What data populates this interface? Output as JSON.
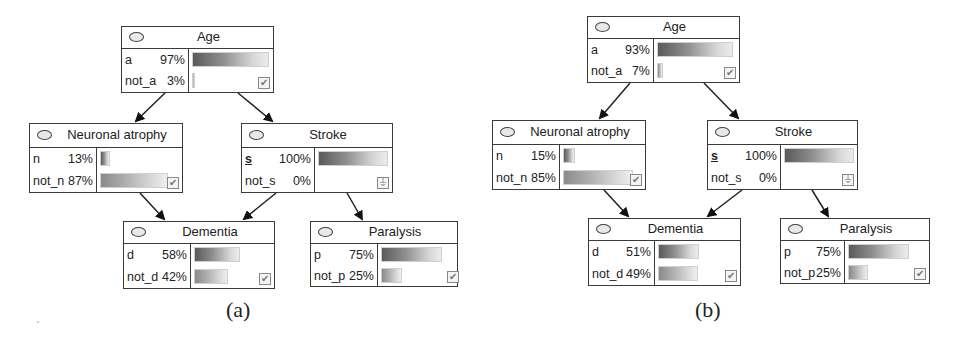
{
  "panels": [
    {
      "caption": "(a)",
      "nodes": {
        "age": {
          "title": "Age",
          "states": [
            {
              "name": "a",
              "pct": "97%",
              "value": 97
            },
            {
              "name": "not_a",
              "pct": "3%",
              "value": 3
            }
          ],
          "indicator": "check"
        },
        "neuronal_atrophy": {
          "title": "Neuronal atrophy",
          "states": [
            {
              "name": "n",
              "pct": "13%",
              "value": 13
            },
            {
              "name": "not_n",
              "pct": "87%",
              "value": 87
            }
          ],
          "indicator": "check"
        },
        "stroke": {
          "title": "Stroke",
          "states": [
            {
              "name": "s",
              "pct": "100%",
              "value": 100,
              "evidence": true
            },
            {
              "name": "not_s",
              "pct": "0%",
              "value": 0
            }
          ],
          "indicator": "evidence"
        },
        "dementia": {
          "title": "Dementia",
          "states": [
            {
              "name": "d",
              "pct": "58%",
              "value": 58
            },
            {
              "name": "not_d",
              "pct": "42%",
              "value": 42
            }
          ],
          "indicator": "check"
        },
        "paralysis": {
          "title": "Paralysis",
          "states": [
            {
              "name": "p",
              "pct": "75%",
              "value": 75
            },
            {
              "name": "not_p",
              "pct": "25%",
              "value": 25
            }
          ],
          "indicator": "check"
        }
      }
    },
    {
      "caption": "(b)",
      "nodes": {
        "age": {
          "title": "Age",
          "states": [
            {
              "name": "a",
              "pct": "93%",
              "value": 93
            },
            {
              "name": "not_a",
              "pct": "7%",
              "value": 7
            }
          ],
          "indicator": "check"
        },
        "neuronal_atrophy": {
          "title": "Neuronal atrophy",
          "states": [
            {
              "name": "n",
              "pct": "15%",
              "value": 15
            },
            {
              "name": "not_n",
              "pct": "85%",
              "value": 85
            }
          ],
          "indicator": "check"
        },
        "stroke": {
          "title": "Stroke",
          "states": [
            {
              "name": "s",
              "pct": "100%",
              "value": 100,
              "evidence": true
            },
            {
              "name": "not_s",
              "pct": "0%",
              "value": 0
            }
          ],
          "indicator": "evidence"
        },
        "dementia": {
          "title": "Dementia",
          "states": [
            {
              "name": "d",
              "pct": "51%",
              "value": 51
            },
            {
              "name": "not_d",
              "pct": "49%",
              "value": 49
            }
          ],
          "indicator": "check"
        },
        "paralysis": {
          "title": "Paralysis",
          "states": [
            {
              "name": "p",
              "pct": "75%",
              "value": 75
            },
            {
              "name": "not_p",
              "pct": "25%",
              "value": 25
            }
          ],
          "indicator": "check"
        }
      }
    }
  ],
  "edges": [
    [
      "age",
      "neuronal_atrophy"
    ],
    [
      "age",
      "stroke"
    ],
    [
      "neuronal_atrophy",
      "dementia"
    ],
    [
      "stroke",
      "dementia"
    ],
    [
      "stroke",
      "paralysis"
    ]
  ],
  "icons": {
    "check": "✔",
    "evidence": "⏚"
  }
}
